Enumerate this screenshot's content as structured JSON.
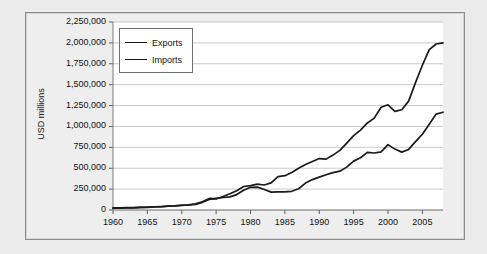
{
  "chart_data": {
    "type": "line",
    "title": "",
    "subtitle": "",
    "xlabel": "",
    "ylabel": "USD millions",
    "xlim": [
      1960,
      2008
    ],
    "ylim": [
      0,
      2250000
    ],
    "grid": true,
    "grid_axis": "y",
    "legend_position": "top-left inside plot",
    "xtick_labels": [
      "1960",
      "1965",
      "1970",
      "1975",
      "1980",
      "1985",
      "1990",
      "1995",
      "2000",
      "2005"
    ],
    "xtick_values": [
      1960,
      1965,
      1970,
      1975,
      1980,
      1985,
      1990,
      1995,
      2000,
      2005
    ],
    "ytick_labels": [
      "0",
      "250,000",
      "500,000",
      "750,000",
      "1,000,000",
      "1,250,000",
      "1,500,000",
      "1,750,000",
      "2,000,000",
      "2,250,000"
    ],
    "ytick_values": [
      0,
      250000,
      500000,
      750000,
      1000000,
      1250000,
      1500000,
      1750000,
      2000000,
      2250000
    ],
    "x": [
      1960,
      1961,
      1962,
      1963,
      1964,
      1965,
      1966,
      1967,
      1968,
      1969,
      1970,
      1971,
      1972,
      1973,
      1974,
      1975,
      1976,
      1977,
      1978,
      1979,
      1980,
      1981,
      1982,
      1983,
      1984,
      1985,
      1986,
      1987,
      1988,
      1989,
      1990,
      1991,
      1992,
      1993,
      1994,
      1995,
      1996,
      1997,
      1998,
      1999,
      2000,
      2001,
      2002,
      2003,
      2004,
      2005,
      2006,
      2007,
      2008
    ],
    "series": [
      {
        "name": "Exports",
        "color": "#1a1a1a",
        "values": [
          25900,
          26400,
          27700,
          29600,
          33300,
          35300,
          38900,
          41300,
          45500,
          49200,
          56600,
          59600,
          67200,
          91800,
          127000,
          138700,
          149500,
          157300,
          184500,
          237000,
          271800,
          274000,
          246000,
          214000,
          218000,
          216000,
          224000,
          254000,
          322000,
          364000,
          393000,
          422000,
          448000,
          465000,
          513000,
          585000,
          625000,
          689000,
          682000,
          696000,
          782000,
          729000,
          693000,
          725000,
          819000,
          907000,
          1026000,
          1148000,
          1170000
        ]
      },
      {
        "name": "Imports",
        "color": "#1a1a1a",
        "values": [
          22400,
          22200,
          24400,
          25400,
          27300,
          30600,
          36000,
          38700,
          45300,
          49000,
          54400,
          60900,
          72700,
          98000,
          138000,
          132000,
          162000,
          194000,
          230000,
          281000,
          291000,
          310000,
          299000,
          324000,
          400000,
          411000,
          448000,
          500000,
          545000,
          580000,
          616000,
          609000,
          657000,
          713000,
          801000,
          890000,
          955000,
          1042000,
          1099000,
          1230000,
          1259000,
          1180000,
          1200000,
          1303000,
          1525000,
          1732000,
          1919000,
          1987000,
          2000000
        ]
      }
    ]
  },
  "legend": {
    "entries": [
      {
        "label": "Exports"
      },
      {
        "label": "Imports"
      }
    ]
  },
  "axis": {
    "y_title": "USD millions"
  }
}
